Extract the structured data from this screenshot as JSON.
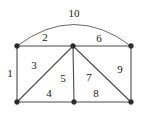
{
  "figure": {
    "name": "undirected-graph-edge-labeled",
    "background_color": "#ffffff",
    "edge_color": "#4a4a4a",
    "arc_color": "#6a6a6a",
    "vertex_color": "#2b2b2b",
    "label_color": "#1a1a1a",
    "width": 141,
    "height": 117
  },
  "vertices": [
    {
      "id": "v-top-left",
      "label": "",
      "x": 17,
      "y": 46
    },
    {
      "id": "v-top-middle",
      "label": "",
      "x": 73,
      "y": 46
    },
    {
      "id": "v-top-right",
      "label": "",
      "x": 131,
      "y": 46
    },
    {
      "id": "v-bottom-left",
      "label": "",
      "x": 17,
      "y": 102
    },
    {
      "id": "v-bottom-middle",
      "label": "",
      "x": 74,
      "y": 102
    },
    {
      "id": "v-bottom-right",
      "label": "",
      "x": 131,
      "y": 102
    }
  ],
  "edges": [
    {
      "id": "edge-1",
      "label": "1",
      "from": "v-top-left",
      "to": "v-bottom-left",
      "shape": "line",
      "label_x": 10,
      "label_y": 73
    },
    {
      "id": "edge-2",
      "label": "2",
      "from": "v-top-left",
      "to": "v-top-middle",
      "shape": "line",
      "label_x": 45,
      "label_y": 37
    },
    {
      "id": "edge-3",
      "label": "3",
      "from": "v-top-middle",
      "to": "v-bottom-left",
      "shape": "line",
      "label_x": 34,
      "label_y": 65
    },
    {
      "id": "edge-4",
      "label": "4",
      "from": "v-bottom-left",
      "to": "v-bottom-middle",
      "shape": "line",
      "label_x": 49,
      "label_y": 93
    },
    {
      "id": "edge-5",
      "label": "5",
      "from": "v-top-middle",
      "to": "v-bottom-middle",
      "shape": "line",
      "label_x": 63,
      "label_y": 78
    },
    {
      "id": "edge-6",
      "label": "6",
      "from": "v-top-middle",
      "to": "v-top-right",
      "shape": "line",
      "label_x": 99,
      "label_y": 38
    },
    {
      "id": "edge-7",
      "label": "7",
      "from": "v-top-middle",
      "to": "v-bottom-right",
      "shape": "line",
      "label_x": 89,
      "label_y": 77
    },
    {
      "id": "edge-8",
      "label": "8",
      "from": "v-bottom-middle",
      "to": "v-bottom-right",
      "shape": "line",
      "label_x": 96,
      "label_y": 93
    },
    {
      "id": "edge-9",
      "label": "9",
      "from": "v-top-right",
      "to": "v-bottom-right",
      "shape": "line",
      "label_x": 120,
      "label_y": 69
    },
    {
      "id": "edge-10",
      "label": "10",
      "from": "v-top-left",
      "to": "v-top-right",
      "shape": "arc",
      "label_x": 74,
      "label_y": 13
    }
  ]
}
